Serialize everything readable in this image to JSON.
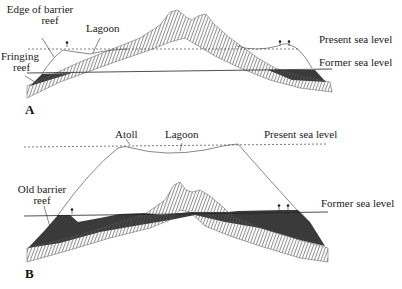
{
  "figure": {
    "panels": [
      {
        "id": "A",
        "label": "A",
        "labels": {
          "edge_of_barrier_reef": [
            "Edge of barrier",
            "reef"
          ],
          "lagoon": "Lagoon",
          "fringing_reef": [
            "Fringing",
            "reef"
          ],
          "present_sea_level": "Present sea level",
          "former_sea_level": "Former sea level"
        }
      },
      {
        "id": "B",
        "label": "B",
        "labels": {
          "atoll": "Atoll",
          "lagoon": "Lagoon",
          "present_sea_level": "Present sea level",
          "old_barrier_reef": [
            "Old barrier",
            "reef"
          ],
          "former_sea_level": "Former sea level"
        }
      }
    ],
    "legend_shapes": {
      "volcano": "hatched-island",
      "reef": "dark-filled",
      "sea_level_present": "dashed-line",
      "sea_level_former": "solid-line"
    },
    "colors": {
      "ink": "#1a1a1a",
      "reef_fill": "#3a3a3a",
      "hatch": "#555555",
      "background": "#ffffff"
    }
  }
}
